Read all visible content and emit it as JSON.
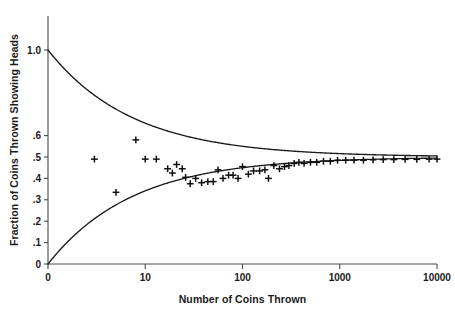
{
  "chart_data": {
    "type": "scatter",
    "title": "",
    "subtitle": "",
    "xlabel": "Number of Coins Thrown",
    "ylabel": "Fraction of Coins Thrown Showing Heads",
    "xscale": "log",
    "yscale": "linear",
    "xlim": [
      1,
      10000
    ],
    "ylim": [
      0,
      1.0
    ],
    "grid": false,
    "legend": null,
    "legend_position": "none",
    "xticks": [
      {
        "value": 1,
        "label": "0"
      },
      {
        "value": 10,
        "label": "10"
      },
      {
        "value": 100,
        "label": "100"
      },
      {
        "value": 1000,
        "label": "1000"
      },
      {
        "value": 10000,
        "label": "10000"
      }
    ],
    "yticks": [
      {
        "value": 0.0,
        "label": "0"
      },
      {
        "value": 0.1,
        "label": ".1"
      },
      {
        "value": 0.2,
        "label": ".2"
      },
      {
        "value": 0.3,
        "label": ".3"
      },
      {
        "value": 0.4,
        "label": ".4"
      },
      {
        "value": 0.5,
        "label": ".5"
      },
      {
        "value": 0.6,
        "label": ".6"
      },
      {
        "value": 1.0,
        "label": "1.0"
      }
    ],
    "marker_style": "plus",
    "series": [
      {
        "name": "Observed fraction of heads",
        "marker": "plus",
        "points": [
          {
            "x": 3,
            "y": 0.49
          },
          {
            "x": 5,
            "y": 0.335
          },
          {
            "x": 8,
            "y": 0.58
          },
          {
            "x": 10,
            "y": 0.49
          },
          {
            "x": 13,
            "y": 0.49
          },
          {
            "x": 17,
            "y": 0.445
          },
          {
            "x": 19,
            "y": 0.425
          },
          {
            "x": 21,
            "y": 0.465
          },
          {
            "x": 24,
            "y": 0.445
          },
          {
            "x": 26,
            "y": 0.405
          },
          {
            "x": 29,
            "y": 0.375
          },
          {
            "x": 33,
            "y": 0.4
          },
          {
            "x": 38,
            "y": 0.38
          },
          {
            "x": 44,
            "y": 0.385
          },
          {
            "x": 50,
            "y": 0.385
          },
          {
            "x": 56,
            "y": 0.44
          },
          {
            "x": 63,
            "y": 0.4
          },
          {
            "x": 72,
            "y": 0.415
          },
          {
            "x": 80,
            "y": 0.415
          },
          {
            "x": 90,
            "y": 0.4
          },
          {
            "x": 100,
            "y": 0.455
          },
          {
            "x": 115,
            "y": 0.42
          },
          {
            "x": 130,
            "y": 0.435
          },
          {
            "x": 150,
            "y": 0.435
          },
          {
            "x": 170,
            "y": 0.44
          },
          {
            "x": 185,
            "y": 0.4
          },
          {
            "x": 210,
            "y": 0.46
          },
          {
            "x": 240,
            "y": 0.445
          },
          {
            "x": 270,
            "y": 0.455
          },
          {
            "x": 300,
            "y": 0.46
          },
          {
            "x": 340,
            "y": 0.47
          },
          {
            "x": 380,
            "y": 0.475
          },
          {
            "x": 430,
            "y": 0.47
          },
          {
            "x": 500,
            "y": 0.475
          },
          {
            "x": 580,
            "y": 0.475
          },
          {
            "x": 680,
            "y": 0.48
          },
          {
            "x": 800,
            "y": 0.48
          },
          {
            "x": 950,
            "y": 0.485
          },
          {
            "x": 1150,
            "y": 0.485
          },
          {
            "x": 1400,
            "y": 0.485
          },
          {
            "x": 1750,
            "y": 0.485
          },
          {
            "x": 2200,
            "y": 0.487
          },
          {
            "x": 2800,
            "y": 0.488
          },
          {
            "x": 3600,
            "y": 0.488
          },
          {
            "x": 4700,
            "y": 0.489
          },
          {
            "x": 6200,
            "y": 0.489
          },
          {
            "x": 8300,
            "y": 0.49
          },
          {
            "x": 10000,
            "y": 0.49
          }
        ]
      }
    ],
    "envelopes": [
      {
        "name": "upper-bound",
        "formula": "0.5 + 0.5/sqrt(N)",
        "start": {
          "x": 1,
          "y": 1.0
        },
        "end": {
          "x": 10000,
          "y": 0.505
        }
      },
      {
        "name": "lower-bound",
        "formula": "0.5 - 0.5/sqrt(N)",
        "start": {
          "x": 1,
          "y": 0.0
        },
        "end": {
          "x": 10000,
          "y": 0.495
        }
      }
    ]
  }
}
